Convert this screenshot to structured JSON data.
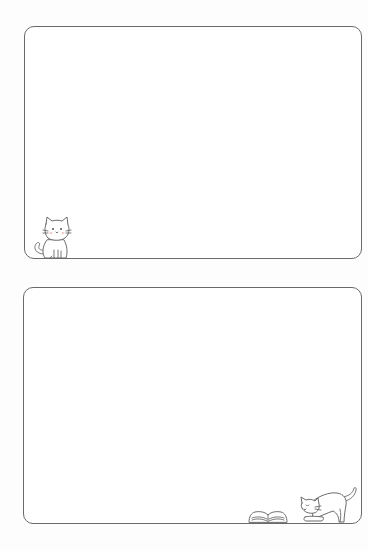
{
  "page": {
    "background": "#fdfdfd",
    "frame_border_color": "#6a6a6a"
  },
  "frames": [
    {
      "id": "frame-top",
      "content": "",
      "decorations": [
        {
          "name": "sitting-cat-icon",
          "position": "bottom-left"
        }
      ]
    },
    {
      "id": "frame-bottom",
      "content": "",
      "decorations": [
        {
          "name": "open-book-icon",
          "position": "bottom-right"
        },
        {
          "name": "stretching-cat-icon",
          "position": "bottom-right"
        }
      ]
    }
  ]
}
